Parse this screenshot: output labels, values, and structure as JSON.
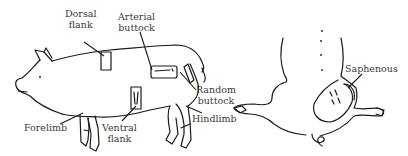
{
  "figure": {
    "left_view": "side-view-pig",
    "right_view": "rear-view-pig",
    "line_color": "#1a1a1a",
    "label_color": "#3a3a3a",
    "background": "#ffffff"
  },
  "labels": {
    "dorsal_flank": {
      "line1": "Dorsal",
      "line2": "flank"
    },
    "arterial_buttock": {
      "line1": "Arterial",
      "line2": "buttock"
    },
    "random_buttock": {
      "line1": "Random",
      "line2": "buttock"
    },
    "hindlimb": {
      "text": "Hindlimb"
    },
    "forelimb": {
      "text": "Forelimb"
    },
    "ventral_flank": {
      "line1": "Ventral",
      "line2": "flank"
    },
    "saphenous": {
      "text": "Saphenous"
    }
  }
}
